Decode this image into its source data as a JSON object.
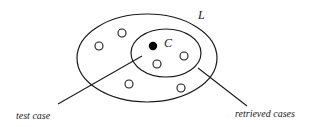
{
  "diagram": {
    "outer_set_label": "L",
    "center_label": "C",
    "test_case_label": "test case",
    "retrieved_cases_label": "retrieved cases",
    "colors": {
      "stroke": "#1a1a1a",
      "background": "#ffffff"
    }
  }
}
